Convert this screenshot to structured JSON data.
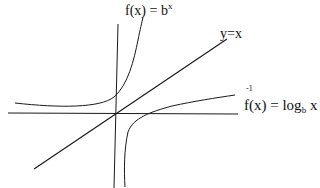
{
  "labels": {
    "exp": {
      "base": "f(x) = b",
      "sup": "x"
    },
    "identity": "y=x",
    "log_inverse_mark": "-1",
    "log": {
      "pre": "f(x) = log",
      "sub": "b",
      "post": " x"
    }
  },
  "colors": {
    "stroke": "#1a1a1a",
    "background": "#ffffff"
  }
}
